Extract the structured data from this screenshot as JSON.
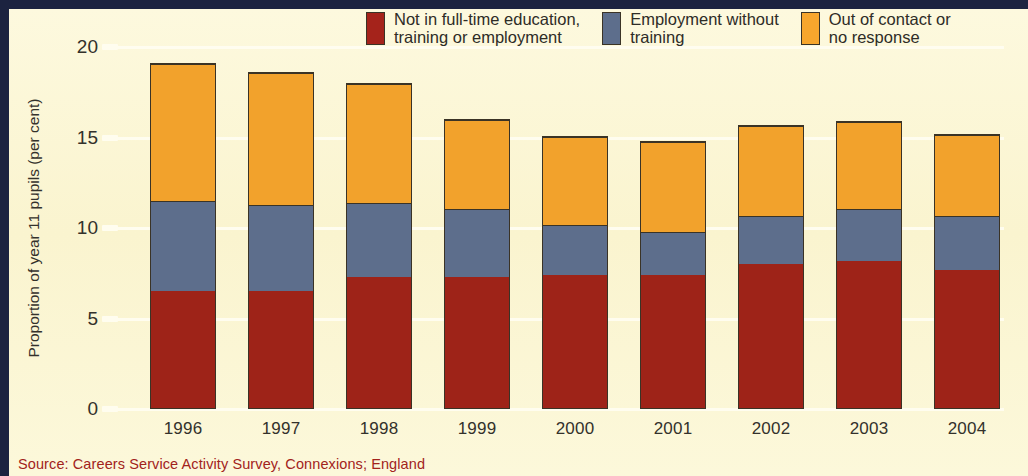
{
  "chart_data": {
    "type": "bar",
    "subtype": "stacked-bar",
    "title": "",
    "xlabel": "",
    "ylabel": "Proportion of year 11 pupils (per cent)",
    "ylim": [
      0,
      20
    ],
    "yticks": [
      0,
      5,
      10,
      15,
      20
    ],
    "ytick_labels": [
      "0",
      "5",
      "10",
      "15",
      "20"
    ],
    "grid": true,
    "grid_axis": "y",
    "legend_position": "top-right",
    "categories": [
      "1996",
      "1997",
      "1998",
      "1999",
      "2000",
      "2001",
      "2002",
      "2003",
      "2004"
    ],
    "series": [
      {
        "name": "Not in full-time education, training or employment",
        "color": "#9e2318",
        "values": [
          6.5,
          6.5,
          7.3,
          7.3,
          7.4,
          7.4,
          8.0,
          8.2,
          7.7
        ]
      },
      {
        "name": "Employment without training",
        "color": "#5d6e8c",
        "values": [
          5.0,
          4.8,
          4.1,
          3.8,
          2.8,
          2.4,
          2.7,
          2.9,
          3.0
        ]
      },
      {
        "name": "Out of contact or no response",
        "color": "#f2a22c",
        "values": [
          7.6,
          7.3,
          6.6,
          4.9,
          4.9,
          5.0,
          5.0,
          4.8,
          4.5
        ]
      }
    ],
    "totals": [
      19.1,
      18.6,
      18.0,
      16.0,
      15.1,
      14.8,
      15.7,
      15.9,
      15.2
    ]
  },
  "legend": {
    "items": [
      {
        "label": "Not in full-time education,\ntraining or employment",
        "color": "#a5231b"
      },
      {
        "label": "Employment without\ntraining",
        "color": "#5d6e8c"
      },
      {
        "label": "Out of contact or\nno response",
        "color": "#f7a62d"
      }
    ]
  },
  "axis": {
    "y_title": "Proportion of year 11 pupils (per cent)",
    "y_tick_labels": [
      "20",
      "15",
      "10",
      "5",
      "0"
    ],
    "x_tick_labels": [
      "1996",
      "1997",
      "1998",
      "1999",
      "2000",
      "2001",
      "2002",
      "2003",
      "2004"
    ]
  },
  "source": {
    "text": "Source: Careers Service Activity Survey, Connexions; England"
  }
}
